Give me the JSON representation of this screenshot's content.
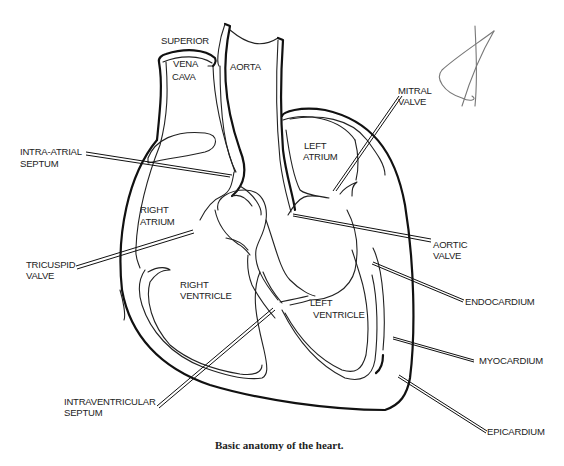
{
  "figure": {
    "caption": "Basic anatomy of the heart.",
    "labels": {
      "superior": "SUPERIOR",
      "vena": "VENA",
      "cava": "CAVA",
      "aorta": "AORTA",
      "mitral_1": "MITRAL",
      "mitral_2": "VALVE",
      "intra_atrial_1": "INTRA-ATRIAL",
      "intra_atrial_2": "SEPTUM",
      "left_atrium_1": "LEFT",
      "left_atrium_2": "ATRIUM",
      "right_atrium_1": "RIGHT",
      "right_atrium_2": "ATRIUM",
      "aortic_1": "AORTIC",
      "aortic_2": "VALVE",
      "tricuspid_1": "TRICUSPID",
      "tricuspid_2": "VALVE",
      "right_ventricle_1": "RIGHT",
      "right_ventricle_2": "VENTRICLE",
      "left_ventricle_1": "LEFT",
      "left_ventricle_2": "VENTRICLE",
      "endocardium": "ENDOCARDIUM",
      "myocardium": "MYOCARDIUM",
      "intraventricular_1": "INTRAVENTRICULAR",
      "intraventricular_2": "SEPTUM",
      "epicardium": "EPICARDIUM"
    }
  }
}
